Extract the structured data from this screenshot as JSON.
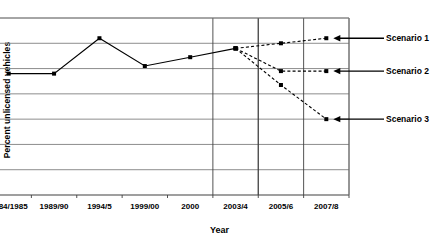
{
  "chart_data": {
    "type": "line",
    "title": "",
    "xlabel": "Year",
    "ylabel": "Percent unlicensed vehicles",
    "categories": [
      "1984/1985",
      "1989/90",
      "1994/5",
      "1999/00",
      "2000",
      "2003/4",
      "2005/6",
      "2007/8"
    ],
    "ylim": [
      0,
      7
    ],
    "yticks": [
      0,
      1,
      2,
      3,
      4,
      5,
      6,
      7
    ],
    "grid": true,
    "legend_position": "right-annotations",
    "series": [
      {
        "name": "Historical",
        "style": "solid",
        "marker": "square",
        "values": [
          4.8,
          4.8,
          6.2,
          5.1,
          5.45,
          5.8,
          null,
          null
        ]
      },
      {
        "name": "Scenario 1",
        "style": "dashed",
        "marker": "square",
        "values": [
          null,
          null,
          null,
          null,
          null,
          5.8,
          6.0,
          6.2
        ]
      },
      {
        "name": "Scenario 2",
        "style": "dashed",
        "marker": "square",
        "values": [
          null,
          null,
          null,
          null,
          null,
          5.8,
          4.9,
          4.9
        ]
      },
      {
        "name": "Scenario 3",
        "style": "dashed",
        "marker": "square",
        "values": [
          null,
          null,
          null,
          null,
          null,
          5.8,
          4.35,
          3.0
        ]
      }
    ],
    "annotations": [
      {
        "label": "Scenario 1",
        "points_to_value": 6.2,
        "points_to_category": "2007/8"
      },
      {
        "label": "Scenario 2",
        "points_to_value": 4.9,
        "points_to_category": "2007/8"
      },
      {
        "label": "Scenario 3",
        "points_to_value": 3.0,
        "points_to_category": "2007/8"
      }
    ]
  },
  "axis": {
    "y_title": "Percent unlicensed vehicles",
    "x_title": "Year",
    "y_ticks": [
      "0",
      "1",
      "2",
      "3",
      "4",
      "5",
      "6",
      "7"
    ],
    "x_ticks": [
      "1984/1985",
      "1989/90",
      "1994/5",
      "1999/00",
      "2000",
      "2003/4",
      "2005/6",
      "2007/8"
    ]
  },
  "annotations": {
    "scenario1": "Scenario 1",
    "scenario2": "Scenario 2",
    "scenario3": "Scenario 3"
  },
  "colors": {
    "line": "#000000",
    "grid": "#808080",
    "axis": "#404040",
    "background": "#ffffff"
  }
}
